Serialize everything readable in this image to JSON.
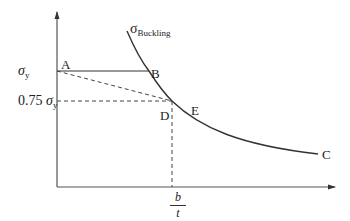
{
  "diagram": {
    "type": "stress-vs-slenderness plot",
    "curve_label": {
      "symbol": "σ",
      "subscript": "Buckling"
    },
    "y_ticks": [
      {
        "prefix": "",
        "symbol": "σ",
        "subscript": "y"
      },
      {
        "prefix": "0.75 ",
        "symbol": "σ",
        "subscript": "y"
      }
    ],
    "x_tick": {
      "numerator": "b",
      "denominator": "t"
    },
    "points": {
      "A": "A",
      "B": "B",
      "C": "C",
      "D": "D",
      "E": "E"
    },
    "colors": {
      "line": "#333333",
      "background": "#ffffff"
    }
  }
}
